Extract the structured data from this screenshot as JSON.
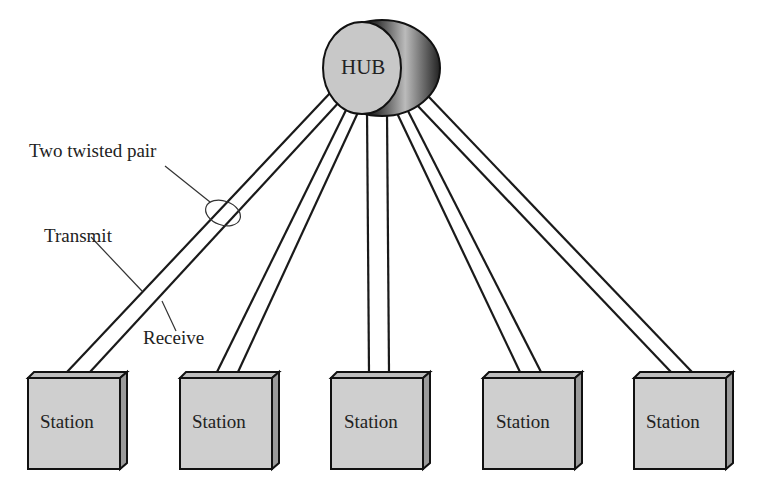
{
  "diagram": {
    "type": "star-topology",
    "hub": {
      "label": "HUB",
      "fill": "#c8c8c8"
    },
    "labels": {
      "pair": "Two twisted pair",
      "transmit": "Transmit",
      "receive": "Receive"
    },
    "stations": [
      {
        "label": "Station"
      },
      {
        "label": "Station"
      },
      {
        "label": "Station"
      },
      {
        "label": "Station"
      },
      {
        "label": "Station"
      }
    ],
    "colors": {
      "station_fill": "#cfcfcf",
      "station_side": "#9a9a9a",
      "line": "#1a1a1a"
    }
  }
}
